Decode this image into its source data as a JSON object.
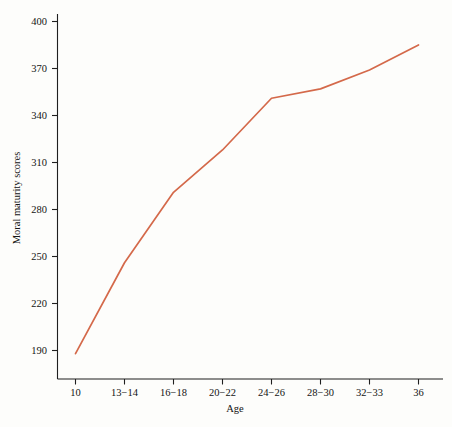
{
  "chart_data": {
    "type": "line",
    "title": "",
    "xlabel": "Age",
    "ylabel": "Moral maturity scores",
    "categories": [
      "10",
      "13−14",
      "16−18",
      "20−22",
      "24−26",
      "28−30",
      "32−33",
      "36"
    ],
    "x_tick_labels": [
      "10",
      "13−14",
      "16−18",
      "20−22",
      "24−26",
      "28−30",
      "32−33",
      "36"
    ],
    "y_tick_labels": [
      "190",
      "220",
      "250",
      "280",
      "310",
      "340",
      "370",
      "400"
    ],
    "y_ticks": [
      190,
      220,
      250,
      280,
      310,
      340,
      370,
      400
    ],
    "ylim": [
      175,
      408
    ],
    "grid": false,
    "legend": false,
    "legend_position": "none",
    "series": [
      {
        "name": "Moral maturity scores",
        "color": "#d4694a",
        "values": [
          188,
          246,
          291,
          318,
          351,
          357,
          369,
          385
        ]
      }
    ]
  },
  "axes": {
    "y_axis_title": "Moral maturity scores",
    "x_axis_title": "Age",
    "y_tick_labels": [
      "400",
      "370",
      "340",
      "310",
      "280",
      "250",
      "220",
      "190"
    ],
    "x_tick_labels": [
      "10",
      "13−14",
      "16−18",
      "20−22",
      "24−26",
      "28−30",
      "32−33",
      "36"
    ]
  },
  "colors": {
    "line": "#d4694a",
    "axis": "#1f1f1f",
    "background": "#fdfdfb",
    "text": "#141414"
  }
}
